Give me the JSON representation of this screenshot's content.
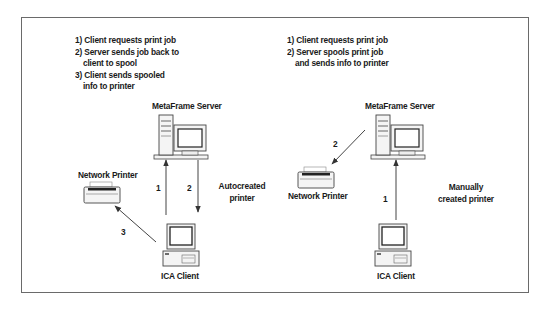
{
  "left_panel": {
    "steps": [
      {
        "text": "1) Client requests print job",
        "indent": false
      },
      {
        "text": "2) Server sends job back to",
        "indent": false
      },
      {
        "text": "client to spool",
        "indent": true
      },
      {
        "text": "3) Client sends spooled",
        "indent": false
      },
      {
        "text": "info to printer",
        "indent": true
      }
    ],
    "server_label": "MetaFrame Server",
    "printer_label": "Network Printer",
    "client_label": "ICA Client",
    "arrow_labels": {
      "a1": "1",
      "a2": "2",
      "a3": "3"
    },
    "mode_label_line1": "Autocreated",
    "mode_label_line2": "printer"
  },
  "right_panel": {
    "steps": [
      {
        "text": "1) Client requests print job",
        "indent": false
      },
      {
        "text": "2) Server spools print job",
        "indent": false
      },
      {
        "text": "and sends info to printer",
        "indent": true
      }
    ],
    "server_label": "MetaFrame Server",
    "printer_label": "Network Printer",
    "client_label": "ICA Client",
    "arrow_labels": {
      "a1": "1",
      "a2": "2"
    },
    "mode_label_line1": "Manually",
    "mode_label_line2": "created printer"
  },
  "colors": {
    "frame": "#6a6a6a",
    "line": "#333333",
    "icon_fill": "#f4f4f4",
    "icon_stroke": "#444444"
  }
}
